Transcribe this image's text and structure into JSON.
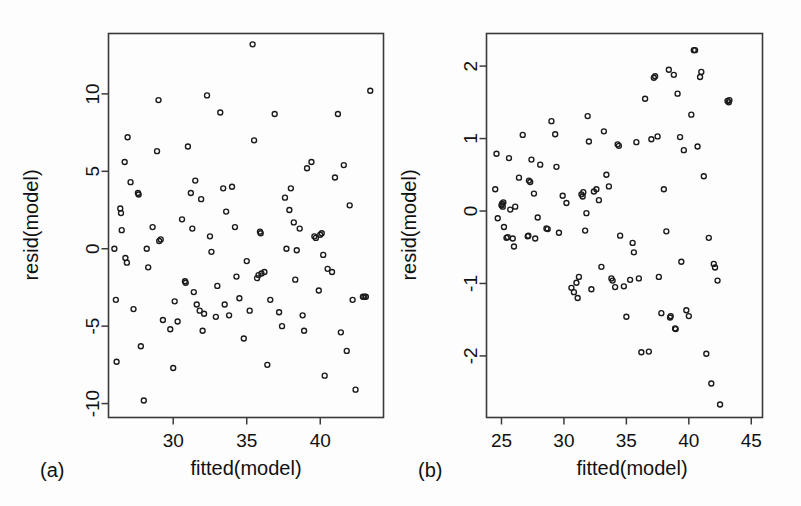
{
  "figure": {
    "background": "#fdfdfd",
    "marker_color": "#1a1a1a",
    "axis_color": "#3a3a3a",
    "panel_a_label": "(a)",
    "panel_b_label": "(b)"
  },
  "chart_data": [
    {
      "type": "scatter",
      "panel": "(a)",
      "title": "",
      "xlabel": "fitted(model)",
      "ylabel": "resid(model)",
      "xlim": [
        25.6,
        44.3
      ],
      "ylim": [
        -10.9,
        13.9
      ],
      "xticks": [
        30,
        35,
        40
      ],
      "xticklabels": [
        "30",
        "35",
        "40"
      ],
      "yticks": [
        -10,
        -5,
        0,
        5,
        10
      ],
      "yticklabels": [
        "-10",
        "-5",
        "0",
        "5",
        "10"
      ],
      "grid": false,
      "legend": "none",
      "marker": "open-circle",
      "points": [
        [
          26.0,
          0.0
        ],
        [
          26.1,
          -3.3
        ],
        [
          26.15,
          -7.3
        ],
        [
          26.4,
          2.6
        ],
        [
          26.45,
          2.3
        ],
        [
          26.5,
          1.2
        ],
        [
          26.7,
          5.6
        ],
        [
          26.75,
          -0.6
        ],
        [
          26.85,
          -0.9
        ],
        [
          26.9,
          7.2
        ],
        [
          27.1,
          4.3
        ],
        [
          27.3,
          -3.9
        ],
        [
          27.6,
          3.6
        ],
        [
          27.65,
          3.5
        ],
        [
          27.8,
          -6.3
        ],
        [
          28.0,
          -9.8
        ],
        [
          28.2,
          0.0
        ],
        [
          28.3,
          -1.2
        ],
        [
          28.6,
          1.4
        ],
        [
          28.9,
          6.3
        ],
        [
          29.0,
          9.6
        ],
        [
          29.05,
          0.5
        ],
        [
          29.15,
          0.6
        ],
        [
          29.3,
          -4.6
        ],
        [
          29.8,
          -5.2
        ],
        [
          30.0,
          -7.7
        ],
        [
          30.1,
          -3.4
        ],
        [
          30.3,
          -4.7
        ],
        [
          30.6,
          1.9
        ],
        [
          30.8,
          -2.1
        ],
        [
          30.85,
          -2.2
        ],
        [
          31.0,
          6.6
        ],
        [
          31.2,
          3.6
        ],
        [
          31.3,
          1.3
        ],
        [
          31.4,
          -2.8
        ],
        [
          31.5,
          4.4
        ],
        [
          31.6,
          -3.6
        ],
        [
          31.8,
          -4.0
        ],
        [
          31.9,
          3.2
        ],
        [
          32.0,
          -5.3
        ],
        [
          32.1,
          -4.2
        ],
        [
          32.3,
          9.9
        ],
        [
          32.5,
          0.8
        ],
        [
          32.6,
          -0.2
        ],
        [
          32.9,
          -4.4
        ],
        [
          33.0,
          -2.4
        ],
        [
          33.2,
          8.8
        ],
        [
          33.4,
          3.9
        ],
        [
          33.5,
          -3.6
        ],
        [
          33.6,
          2.4
        ],
        [
          33.8,
          -4.3
        ],
        [
          34.0,
          4.0
        ],
        [
          34.2,
          1.4
        ],
        [
          34.3,
          -1.8
        ],
        [
          34.5,
          -3.2
        ],
        [
          34.8,
          -5.8
        ],
        [
          35.0,
          -0.8
        ],
        [
          35.2,
          -4.0
        ],
        [
          35.4,
          13.2
        ],
        [
          35.5,
          7.0
        ],
        [
          35.7,
          -1.9
        ],
        [
          35.8,
          -1.7
        ],
        [
          35.9,
          1.1
        ],
        [
          35.95,
          1.0
        ],
        [
          36.0,
          -1.6
        ],
        [
          36.2,
          -1.5
        ],
        [
          36.4,
          -7.5
        ],
        [
          36.6,
          -3.3
        ],
        [
          36.9,
          8.7
        ],
        [
          37.2,
          -4.1
        ],
        [
          37.4,
          -5.0
        ],
        [
          37.6,
          3.3
        ],
        [
          37.7,
          0.0
        ],
        [
          37.9,
          2.5
        ],
        [
          38.0,
          3.9
        ],
        [
          38.2,
          1.7
        ],
        [
          38.3,
          -2.0
        ],
        [
          38.4,
          -0.1
        ],
        [
          38.6,
          1.3
        ],
        [
          38.8,
          -4.3
        ],
        [
          38.9,
          -5.3
        ],
        [
          39.1,
          5.2
        ],
        [
          39.4,
          5.6
        ],
        [
          39.6,
          0.8
        ],
        [
          39.7,
          0.7
        ],
        [
          39.9,
          -2.7
        ],
        [
          40.0,
          0.9
        ],
        [
          40.1,
          1.0
        ],
        [
          40.2,
          -0.4
        ],
        [
          40.3,
          -8.2
        ],
        [
          40.5,
          -1.3
        ],
        [
          40.8,
          -1.5
        ],
        [
          41.0,
          4.6
        ],
        [
          41.2,
          8.7
        ],
        [
          41.4,
          -5.4
        ],
        [
          41.6,
          5.4
        ],
        [
          41.8,
          -6.6
        ],
        [
          42.0,
          2.8
        ],
        [
          42.2,
          -3.3
        ],
        [
          42.4,
          -9.1
        ],
        [
          42.9,
          -3.1
        ],
        [
          43.0,
          -3.1
        ],
        [
          43.1,
          -3.1
        ],
        [
          43.4,
          10.2
        ]
      ]
    },
    {
      "type": "scatter",
      "panel": "(b)",
      "title": "",
      "xlabel": "fitted(model)",
      "ylabel": "resid(model)",
      "xlim": [
        23.8,
        45.9
      ],
      "ylim": [
        -2.85,
        2.45
      ],
      "xticks": [
        25,
        30,
        35,
        40,
        45
      ],
      "xticklabels": [
        "25",
        "30",
        "35",
        "40",
        "45"
      ],
      "yticks": [
        -2,
        -1,
        0,
        1,
        2
      ],
      "yticklabels": [
        "-2",
        "-1",
        "0",
        "1",
        "2"
      ],
      "grid": false,
      "legend": "none",
      "marker": "open-circle",
      "points": [
        [
          24.5,
          0.3
        ],
        [
          24.6,
          0.79
        ],
        [
          24.7,
          -0.1
        ],
        [
          25.0,
          0.08
        ],
        [
          25.05,
          0.1
        ],
        [
          25.1,
          0.06
        ],
        [
          25.15,
          0.12
        ],
        [
          25.2,
          -0.22
        ],
        [
          25.4,
          -0.37
        ],
        [
          25.5,
          -0.36
        ],
        [
          25.6,
          0.73
        ],
        [
          25.7,
          0.02
        ],
        [
          25.9,
          -0.38
        ],
        [
          26.0,
          -0.49
        ],
        [
          26.1,
          0.06
        ],
        [
          26.4,
          0.46
        ],
        [
          26.7,
          1.05
        ],
        [
          27.1,
          -0.35
        ],
        [
          27.15,
          -0.34
        ],
        [
          27.2,
          0.42
        ],
        [
          27.3,
          0.4
        ],
        [
          27.4,
          0.71
        ],
        [
          27.6,
          0.24
        ],
        [
          27.7,
          -0.38
        ],
        [
          27.9,
          -0.09
        ],
        [
          28.1,
          0.64
        ],
        [
          28.6,
          -0.24
        ],
        [
          28.7,
          -0.25
        ],
        [
          29.0,
          1.24
        ],
        [
          29.3,
          1.06
        ],
        [
          29.4,
          0.61
        ],
        [
          29.6,
          -0.3
        ],
        [
          29.9,
          0.21
        ],
        [
          30.2,
          0.11
        ],
        [
          30.6,
          -1.06
        ],
        [
          30.8,
          -1.12
        ],
        [
          31.0,
          -0.99
        ],
        [
          31.1,
          -1.2
        ],
        [
          31.2,
          -0.91
        ],
        [
          31.4,
          0.23
        ],
        [
          31.5,
          0.2
        ],
        [
          31.55,
          0.26
        ],
        [
          31.7,
          -0.27
        ],
        [
          31.8,
          -0.03
        ],
        [
          31.9,
          1.31
        ],
        [
          32.0,
          0.96
        ],
        [
          32.2,
          -1.08
        ],
        [
          32.4,
          0.27
        ],
        [
          32.6,
          0.3
        ],
        [
          32.8,
          0.15
        ],
        [
          33.0,
          -0.77
        ],
        [
          33.2,
          1.1
        ],
        [
          33.4,
          0.5
        ],
        [
          33.6,
          0.34
        ],
        [
          33.8,
          -0.93
        ],
        [
          33.9,
          -0.96
        ],
        [
          34.1,
          -1.05
        ],
        [
          34.3,
          0.92
        ],
        [
          34.4,
          0.9
        ],
        [
          34.5,
          -0.34
        ],
        [
          34.8,
          -1.04
        ],
        [
          35.0,
          -1.46
        ],
        [
          35.3,
          -0.95
        ],
        [
          35.5,
          -0.44
        ],
        [
          35.6,
          -0.57
        ],
        [
          35.8,
          0.95
        ],
        [
          36.0,
          -0.93
        ],
        [
          36.2,
          -1.95
        ],
        [
          36.5,
          1.55
        ],
        [
          36.8,
          -1.94
        ],
        [
          37.0,
          0.99
        ],
        [
          37.2,
          1.84
        ],
        [
          37.3,
          1.86
        ],
        [
          37.5,
          1.03
        ],
        [
          37.6,
          -0.91
        ],
        [
          37.8,
          -1.41
        ],
        [
          38.0,
          0.3
        ],
        [
          38.2,
          -0.28
        ],
        [
          38.4,
          1.95
        ],
        [
          38.5,
          -1.47
        ],
        [
          38.55,
          -1.45
        ],
        [
          38.8,
          1.88
        ],
        [
          38.9,
          -1.62
        ],
        [
          38.95,
          -1.63
        ],
        [
          39.1,
          1.62
        ],
        [
          39.3,
          1.02
        ],
        [
          39.4,
          -0.7
        ],
        [
          39.6,
          0.84
        ],
        [
          39.8,
          -1.37
        ],
        [
          40.0,
          -1.45
        ],
        [
          40.2,
          1.33
        ],
        [
          40.4,
          2.22
        ],
        [
          40.5,
          2.22
        ],
        [
          40.7,
          0.89
        ],
        [
          40.9,
          1.85
        ],
        [
          41.0,
          1.92
        ],
        [
          41.2,
          0.48
        ],
        [
          41.4,
          -1.97
        ],
        [
          41.6,
          -0.37
        ],
        [
          41.8,
          -2.38
        ],
        [
          42.0,
          -0.73
        ],
        [
          42.1,
          -0.78
        ],
        [
          42.3,
          -0.96
        ],
        [
          42.5,
          -2.67
        ],
        [
          43.1,
          1.52
        ],
        [
          43.2,
          1.5
        ],
        [
          43.25,
          1.53
        ]
      ]
    }
  ]
}
